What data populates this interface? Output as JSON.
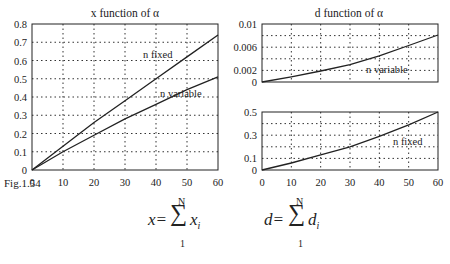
{
  "figure_label": "Fig.1.54",
  "formulas": {
    "x": {
      "lhs": "x=",
      "sum": "∑",
      "upper": "N",
      "lower": "1",
      "term": "x",
      "sub": "i"
    },
    "d": {
      "lhs": "d=",
      "sum": "∑",
      "upper": "N",
      "lower": "1",
      "term": "d",
      "sub": "i"
    }
  },
  "chart_data": [
    {
      "type": "line",
      "title": "x function of α",
      "xlabel": "",
      "ylabel": "",
      "xlim": [
        0,
        60
      ],
      "ylim": [
        0,
        0.8
      ],
      "xticks": [
        "0",
        "10",
        "20",
        "30",
        "40",
        "50",
        "60"
      ],
      "yticks": [
        "0",
        "0.1",
        "0.2",
        "0.3",
        "0.4",
        "0.5",
        "0.6",
        "0.7",
        "0.8"
      ],
      "grid": true,
      "x": [
        0,
        10,
        20,
        30,
        40,
        50,
        60
      ],
      "series": [
        {
          "name": "n fixed",
          "values": [
            0,
            0.13,
            0.26,
            0.38,
            0.5,
            0.62,
            0.74
          ]
        },
        {
          "name": "n variable",
          "values": [
            0,
            0.1,
            0.19,
            0.28,
            0.36,
            0.44,
            0.51
          ]
        }
      ],
      "annotations": [
        "n fixed",
        "n variable"
      ]
    },
    {
      "type": "line",
      "title": "d function of α",
      "xlabel": "",
      "ylabel": "",
      "xlim": [
        0,
        60
      ],
      "ylim": [
        0,
        0.01
      ],
      "yticks": [
        "0",
        "0.002",
        "0.006",
        "0.01"
      ],
      "grid": true,
      "x": [
        0,
        10,
        20,
        30,
        40,
        50,
        60
      ],
      "series": [
        {
          "name": "n variable",
          "values": [
            0,
            0.0009,
            0.0019,
            0.003,
            0.0045,
            0.0063,
            0.0081
          ]
        }
      ],
      "annotations": [
        "n variable"
      ]
    },
    {
      "type": "line",
      "title": "",
      "xlabel": "",
      "ylabel": "",
      "xlim": [
        0,
        60
      ],
      "ylim": [
        0,
        0.5
      ],
      "xticks": [
        "0",
        "10",
        "20",
        "30",
        "40",
        "50",
        "60"
      ],
      "yticks": [
        "0",
        "0.1",
        "0.3",
        "0.5"
      ],
      "grid": true,
      "x": [
        0,
        10,
        20,
        30,
        40,
        50,
        60
      ],
      "series": [
        {
          "name": "n fixed",
          "values": [
            0,
            0.06,
            0.13,
            0.2,
            0.29,
            0.39,
            0.5
          ]
        }
      ],
      "annotations": [
        "n fixed"
      ]
    }
  ]
}
